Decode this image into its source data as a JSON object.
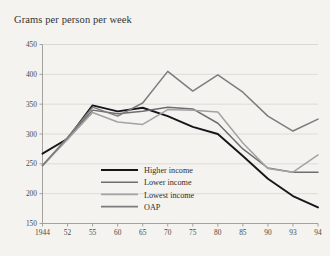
{
  "chart_data": {
    "type": "line",
    "title": "Grams per person per week",
    "xlabel": "",
    "ylabel": "",
    "grid": true,
    "legend_position": "inside-bottom-left",
    "x": [
      1944,
      52,
      55,
      60,
      65,
      70,
      75,
      80,
      85,
      90,
      93,
      94
    ],
    "categories": [
      "1944",
      "52",
      "55",
      "60",
      "65",
      "70",
      "75",
      "80",
      "85",
      "90",
      "93",
      "94"
    ],
    "xlim": [
      0,
      11
    ],
    "ylim": [
      150,
      450
    ],
    "yticks": [
      150,
      200,
      250,
      300,
      350,
      400,
      450
    ],
    "series": [
      {
        "name": "Higher income",
        "color": "#16161a",
        "width": 1.9,
        "values": [
          267,
          292,
          348,
          338,
          344,
          330,
          312,
          300,
          263,
          225,
          196,
          177
        ]
      },
      {
        "name": "Lower income",
        "color": "#6e6e70",
        "width": 1.5,
        "values": [
          247,
          293,
          340,
          334,
          338,
          345,
          342,
          318,
          275,
          243,
          236,
          236
        ]
      },
      {
        "name": "Lowest income",
        "color": "#a3a3a3",
        "width": 1.5,
        "values": [
          247,
          291,
          336,
          320,
          316,
          341,
          340,
          337,
          285,
          242,
          236,
          265
        ]
      },
      {
        "name": "OAP",
        "color": "#7c7c7e",
        "width": 1.5,
        "values": [
          247,
          294,
          345,
          330,
          352,
          405,
          372,
          399,
          370,
          330,
          305,
          325
        ]
      }
    ]
  },
  "legend": {
    "items": [
      {
        "label": "Higher income",
        "color": "#16161a"
      },
      {
        "label": "Lower income",
        "color": "#6e6e70"
      },
      {
        "label": "Lowest income",
        "color": "#a3a3a3"
      },
      {
        "label": "OAP",
        "color": "#7c7c7e"
      }
    ]
  }
}
